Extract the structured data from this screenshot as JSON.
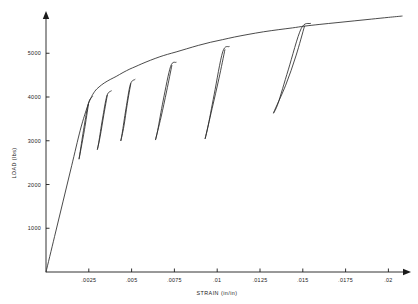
{
  "figure": {
    "title": "",
    "background_color": "#ffffff",
    "line_color": "#2a2a2a",
    "axis_color": "#1b1b1b"
  },
  "axes": {
    "x_title": "STRAIN (in/in)",
    "y_title": "LOAD (lbs)",
    "x_tick_labels": [
      ".0025",
      ".005",
      ".0075",
      ".01",
      ".0125",
      ".015",
      ".0175",
      ".02"
    ],
    "y_tick_labels": [
      "1000",
      "2000",
      "3000",
      "4000",
      "5000"
    ]
  },
  "chart_data": {
    "type": "line",
    "title": "",
    "xlabel": "STRAIN (in/in)",
    "ylabel": "LOAD (lbs)",
    "xlim": [
      0,
      0.0215
    ],
    "ylim": [
      0,
      6200
    ],
    "xticks": [
      0.0025,
      0.005,
      0.0075,
      0.01,
      0.0125,
      0.015,
      0.0175,
      0.02
    ],
    "xticklabels": [
      ".0025",
      ".005",
      ".0075",
      ".01",
      ".0125",
      ".015",
      ".0175",
      ".02"
    ],
    "yticks": [
      1000,
      2000,
      3000,
      4000,
      5000
    ],
    "yticklabels": [
      "1000",
      "2000",
      "3000",
      "4000",
      "5000"
    ],
    "grid": false,
    "legend": "none",
    "series": [
      {
        "name": "envelope",
        "comment": "Monotonic loading envelope: linear elastic rise then yielding and strain hardening",
        "x": [
          0.0,
          0.0005,
          0.001,
          0.0015,
          0.002,
          0.00235,
          0.0026,
          0.00285,
          0.0031,
          0.0034,
          0.00375,
          0.0041,
          0.0045,
          0.0049,
          0.0052,
          0.0056,
          0.0061,
          0.00665,
          0.0071,
          0.0076,
          0.0082,
          0.0089,
          0.0096,
          0.0103,
          0.011,
          0.0118,
          0.0127,
          0.0136,
          0.0144,
          0.0151,
          0.016,
          0.017,
          0.018,
          0.019,
          0.02,
          0.0208
        ],
        "y": [
          0,
          810,
          1620,
          2430,
          3240,
          3700,
          3960,
          4130,
          4230,
          4320,
          4400,
          4470,
          4560,
          4640,
          4690,
          4760,
          4840,
          4920,
          4975,
          5030,
          5100,
          5180,
          5250,
          5310,
          5370,
          5430,
          5490,
          5540,
          5580,
          5620,
          5660,
          5700,
          5740,
          5780,
          5820,
          5850
        ]
      },
      {
        "name": "unload-reload-loop-1",
        "peak_strain": 0.00248,
        "peak_load": 3830,
        "min_strain": 0.00193,
        "min_load": 2580,
        "x": [
          0.00248,
          0.00225,
          0.00205,
          0.00193,
          0.002,
          0.00222,
          0.00248,
          0.00272
        ],
        "y": [
          3830,
          3260,
          2830,
          2580,
          2760,
          3310,
          3860,
          4010
        ]
      },
      {
        "name": "unload-reload-loop-2",
        "peak_strain": 0.00358,
        "peak_load": 4040,
        "min_strain": 0.003,
        "min_load": 2800,
        "x": [
          0.00358,
          0.00338,
          0.00316,
          0.003,
          0.00308,
          0.0033,
          0.00356,
          0.00382
        ],
        "y": [
          4040,
          3600,
          3090,
          2800,
          2960,
          3500,
          4030,
          4140
        ]
      },
      {
        "name": "unload-reload-loop-3",
        "peak_strain": 0.00495,
        "peak_load": 4300,
        "min_strain": 0.00437,
        "min_load": 3000,
        "x": [
          0.00495,
          0.00475,
          0.00455,
          0.00437,
          0.00445,
          0.00467,
          0.00493,
          0.0052
        ],
        "y": [
          4300,
          3850,
          3330,
          3000,
          3170,
          3730,
          4290,
          4400
        ]
      },
      {
        "name": "unload-reload-loop-4",
        "peak_strain": 0.00735,
        "peak_load": 4720,
        "min_strain": 0.0064,
        "min_load": 3030,
        "x": [
          0.00735,
          0.00705,
          0.00672,
          0.0064,
          0.00652,
          0.00685,
          0.00728,
          0.0076
        ],
        "y": [
          4720,
          4140,
          3540,
          3030,
          3230,
          3930,
          4700,
          4790
        ]
      },
      {
        "name": "unload-reload-loop-5",
        "peak_strain": 0.01045,
        "peak_load": 5080,
        "min_strain": 0.0093,
        "min_load": 3060,
        "x": [
          0.01045,
          0.0101,
          0.0097,
          0.0093,
          0.00945,
          0.00982,
          0.01032,
          0.0107
        ],
        "y": [
          5080,
          4420,
          3730,
          3060,
          3300,
          4050,
          5030,
          5150
        ]
      },
      {
        "name": "unload-reload-loop-6",
        "peak_strain": 0.0151,
        "peak_load": 5620,
        "min_strain": 0.0133,
        "min_load": 3650,
        "x": [
          0.0151,
          0.0146,
          0.014,
          0.0133,
          0.01355,
          0.01415,
          0.0149,
          0.01545
        ],
        "y": [
          5620,
          4940,
          4270,
          3650,
          3850,
          4620,
          5560,
          5680
        ]
      }
    ]
  }
}
